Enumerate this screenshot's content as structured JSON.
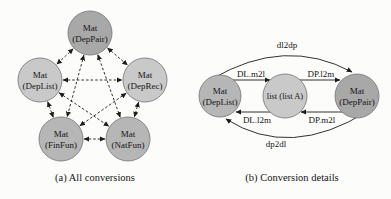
{
  "colors": {
    "node-dark": "#a8a8a8",
    "node-medium": "#b6b6b6",
    "node-light": "#c9c9c9",
    "node-stroke": "#7d7d7d",
    "edge": "#1c1c1c",
    "background": "#fcfcfa"
  },
  "diagram_a": {
    "caption": "(a) All conversions",
    "nodes": {
      "deppair": {
        "line1": "Mat",
        "line2": "(DepPair)"
      },
      "deplist": {
        "line1": "Mat",
        "line2": "(DepList)"
      },
      "deprec": {
        "line1": "Mat",
        "line2": "(DepRec)"
      },
      "finfun": {
        "line1": "Mat",
        "line2": "(FinFun)"
      },
      "natfun": {
        "line1": "Mat",
        "line2": "(NatFun)"
      }
    }
  },
  "diagram_b": {
    "caption": "(b) Conversion details",
    "nodes": {
      "deplist": {
        "line1": "Mat",
        "line2": "(DepList)"
      },
      "list": {
        "label": "list (list A)"
      },
      "deppair": {
        "line1": "Mat",
        "line2": "(DepPair)"
      }
    },
    "edge_labels": {
      "dl2dp": "dl2dp",
      "dp2dl": "dp2dl",
      "dl_m2l": "DL.m2l",
      "dp_l2m": "DP.l2m",
      "dl_l2m": "DL.l2m",
      "dp_m2l": "DP.m2l"
    }
  }
}
